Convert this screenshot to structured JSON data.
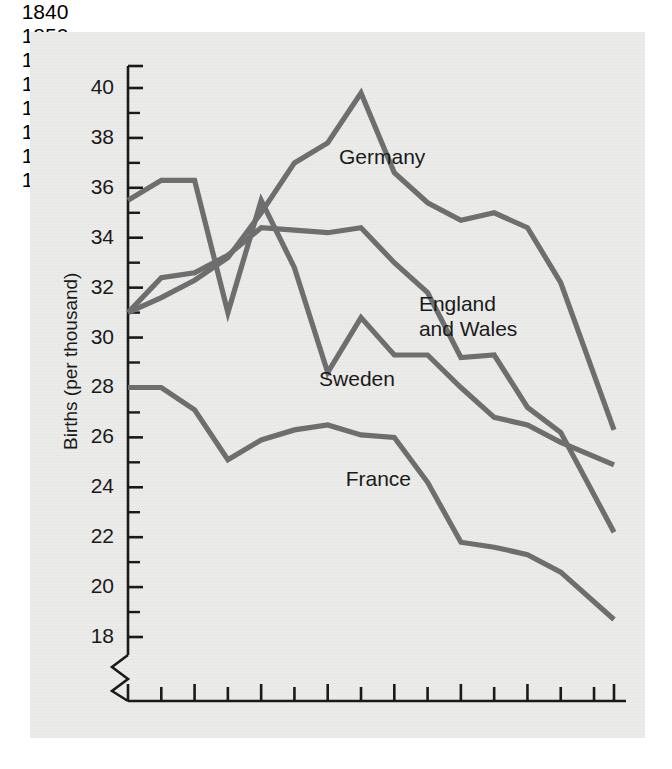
{
  "figure": {
    "background_color": "#ffffff",
    "panel_color": "#ebebe9",
    "line_color": "#6e6e6e",
    "axis_color": "#1a1a1a",
    "text_color": "#1a1a1a"
  },
  "chart_data": {
    "type": "line",
    "title": "",
    "xlabel": "",
    "ylabel": "Births (per thousand)",
    "xlim": [
      1840,
      1913
    ],
    "ylim": [
      17,
      41
    ],
    "grid": false,
    "legend": "inline-labels",
    "axis_break": true,
    "y_ticks_major": [
      18,
      20,
      22,
      24,
      26,
      28,
      30,
      32,
      34,
      36,
      38,
      40
    ],
    "y_ticks_minor": [
      19,
      21,
      23,
      25,
      27,
      29,
      31,
      33,
      35,
      37,
      39
    ],
    "x_ticks_labeled": [
      1840,
      1850,
      1860,
      1870,
      1880,
      1890,
      1900,
      1913
    ],
    "x_ticks_minor": [
      1845,
      1855,
      1865,
      1875,
      1885,
      1895,
      1905,
      1910
    ],
    "x": [
      1840,
      1845,
      1850,
      1855,
      1860,
      1865,
      1870,
      1875,
      1880,
      1885,
      1890,
      1895,
      1900,
      1905,
      1913
    ],
    "series": [
      {
        "name": "Germany",
        "label": "Germany",
        "label_x": 1875,
        "label_y": 37.2,
        "values": [
          31.0,
          31.6,
          32.3,
          33.2,
          35.0,
          37.0,
          37.8,
          39.8,
          36.6,
          35.4,
          34.7,
          35.0,
          34.4,
          32.2,
          26.3
        ]
      },
      {
        "name": "England and Wales",
        "label": "England\nand Wales",
        "label_line1": "England",
        "label_line2": "and Wales",
        "label_x": 1887,
        "label_y": 31.3,
        "values": [
          31.0,
          32.4,
          32.6,
          33.3,
          34.4,
          34.3,
          34.2,
          34.4,
          33.0,
          31.8,
          29.2,
          29.3,
          27.2,
          26.2,
          22.2
        ]
      },
      {
        "name": "Sweden",
        "label": "Sweden",
        "label_x": 1872,
        "label_y": 28.3,
        "values": [
          35.5,
          36.3,
          36.3,
          31.0,
          35.5,
          32.8,
          28.6,
          30.8,
          29.3,
          29.3,
          28.0,
          26.8,
          26.5,
          25.8,
          24.9
        ]
      },
      {
        "name": "France",
        "label": "France",
        "label_x": 1876,
        "label_y": 24.3,
        "values": [
          28.0,
          28.0,
          27.1,
          25.1,
          25.9,
          26.3,
          26.5,
          26.1,
          26.0,
          24.2,
          21.8,
          21.6,
          21.3,
          20.6,
          18.7
        ]
      }
    ]
  }
}
